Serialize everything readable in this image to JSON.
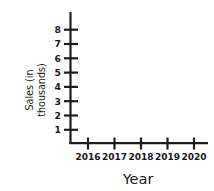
{
  "chart_data": {
    "type": "line",
    "title": "",
    "xlabel": "Year",
    "ylabel_line1": "Sales (in",
    "ylabel_line2": "thousands)",
    "ylabel": "Sales (in thousands)",
    "categories": [
      "2016",
      "2017",
      "2018",
      "2019",
      "2020"
    ],
    "x": [
      2016,
      2017,
      2018,
      2019,
      2020
    ],
    "values": [
      2,
      4,
      2.9,
      5.8,
      5
    ],
    "series": [
      {
        "name": "Sales",
        "values": [
          2,
          4,
          2.9,
          5.8,
          5
        ]
      }
    ],
    "xtick_labels": [
      "2016",
      "2017",
      "2018",
      "2019",
      "2020"
    ],
    "ytick_labels": [
      "1",
      "2",
      "3",
      "4",
      "5",
      "6",
      "7",
      "8"
    ],
    "ytick_values": [
      1,
      2,
      3,
      4,
      5,
      6,
      7,
      8
    ],
    "ylim": [
      0,
      8.6
    ],
    "xlim": [
      2015.5,
      2020.4
    ],
    "grid": false,
    "legend": false,
    "legend_position": "none",
    "line_color": "#212121",
    "axis_color": "#1c1c1c",
    "background_color": "#ffffff",
    "markers": false
  }
}
